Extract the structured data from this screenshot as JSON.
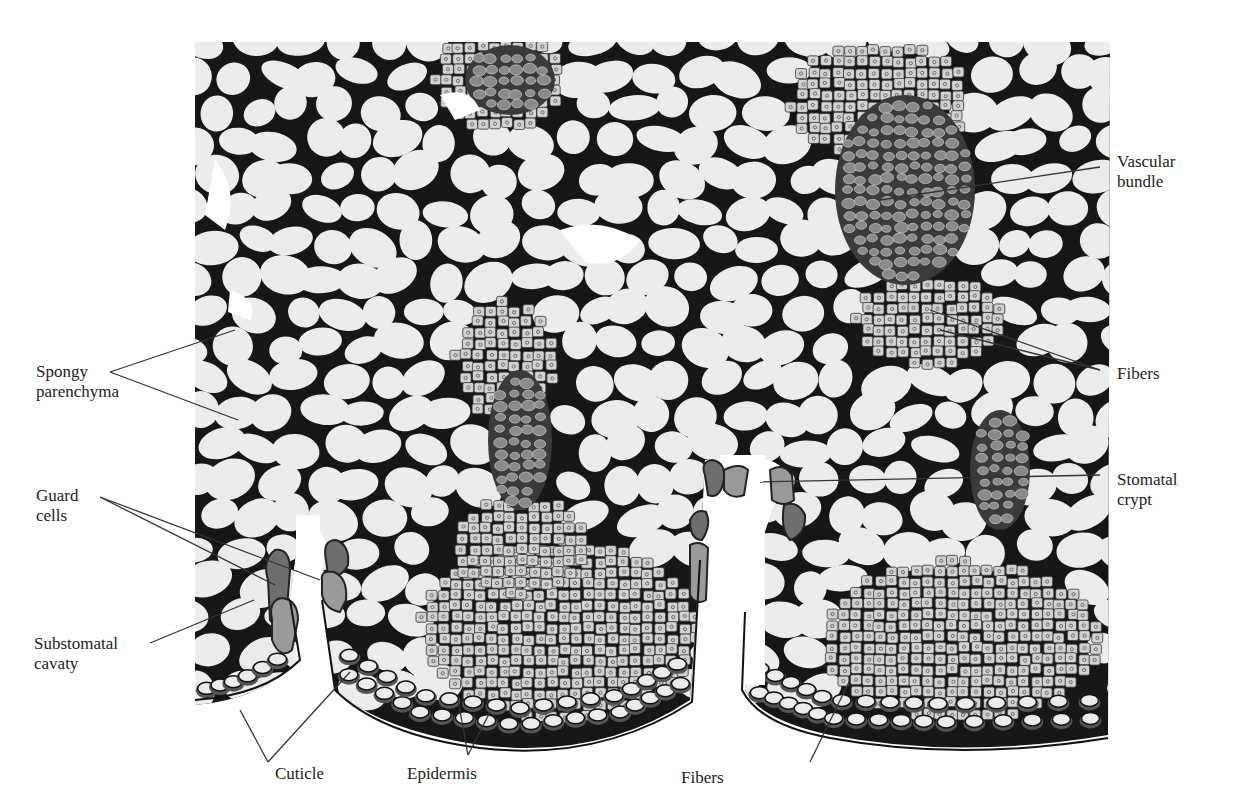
{
  "figure": {
    "colors": {
      "background": "#ffffff",
      "cell_fill": "#ececec",
      "cell_wall": "#111111",
      "fiber_fill": "#d2d2d2",
      "vascular_fill": "#8a8a8a",
      "vascular_dark": "#3a3a3a",
      "guard_cell_dark": "#6e6e6e",
      "guard_cell_light": "#9a9a9a",
      "cuticle": "#e6e6e6",
      "leader_line": "#333333"
    }
  },
  "labels": {
    "vascular_bundle": {
      "line1": "Vascular",
      "line2": "bundle"
    },
    "fibers_right": {
      "line1": "Fibers"
    },
    "spongy_parenchyma": {
      "line1": "Spongy",
      "line2": "parenchyma"
    },
    "guard_cells": {
      "line1": "Guard",
      "line2": "cells"
    },
    "stomatal_crypt": {
      "line1": "Stomatal",
      "line2": "crypt"
    },
    "substomatal_cavaty": {
      "line1": "Substomatal",
      "line2": "cavaty"
    },
    "cuticle": {
      "line1": "Cuticle"
    },
    "epidermis": {
      "line1": "Epidermis"
    },
    "fibers_bottom": {
      "line1": "Fibers"
    }
  }
}
